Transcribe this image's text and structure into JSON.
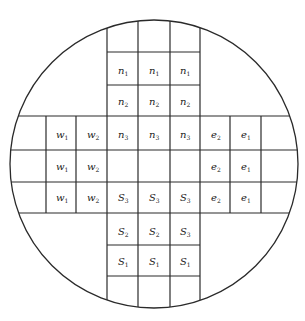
{
  "diagram": {
    "type": "circular-grid-cross",
    "circle": {
      "cx": 154,
      "cy": 164,
      "r": 144
    },
    "colors": {
      "line": "#2a2a2a",
      "text": "#222222",
      "background": "#ffffff"
    },
    "vertical_band": {
      "x": [
        107,
        138,
        170,
        200
      ],
      "y_top": 0,
      "y_bottom": 321
    },
    "horizontal_band": {
      "y": [
        116,
        150,
        182,
        213
      ],
      "x_left": 0,
      "x_right": 305
    },
    "vertical_band_row_lines": [
      52,
      85,
      245,
      276
    ],
    "horizontal_band_col_lines": [
      46,
      76,
      230,
      261
    ],
    "labels": [
      {
        "id": "n1-a",
        "base": "n",
        "sub": "1",
        "x": 122,
        "y": 71
      },
      {
        "id": "n1-b",
        "base": "n",
        "sub": "1",
        "x": 153,
        "y": 71
      },
      {
        "id": "n1-c",
        "base": "n",
        "sub": "1",
        "x": 184,
        "y": 71
      },
      {
        "id": "n2-a",
        "base": "n",
        "sub": "2",
        "x": 122,
        "y": 102
      },
      {
        "id": "n2-b",
        "base": "n",
        "sub": "2",
        "x": 153,
        "y": 102
      },
      {
        "id": "n2-c",
        "base": "n",
        "sub": "2",
        "x": 184,
        "y": 102
      },
      {
        "id": "n3-a",
        "base": "n",
        "sub": "3",
        "x": 122,
        "y": 135
      },
      {
        "id": "n3-b",
        "base": "n",
        "sub": "3",
        "x": 153,
        "y": 135
      },
      {
        "id": "n3-c",
        "base": "n",
        "sub": "3",
        "x": 184,
        "y": 135
      },
      {
        "id": "w1-a",
        "base": "w",
        "sub": "1",
        "x": 60,
        "y": 135
      },
      {
        "id": "w2-a",
        "base": "w",
        "sub": "2",
        "x": 91,
        "y": 135
      },
      {
        "id": "w1-b",
        "base": "w",
        "sub": "1",
        "x": 60,
        "y": 167
      },
      {
        "id": "w2-b",
        "base": "w",
        "sub": "2",
        "x": 91,
        "y": 167
      },
      {
        "id": "w1-c",
        "base": "w",
        "sub": "1",
        "x": 60,
        "y": 198
      },
      {
        "id": "w2-c",
        "base": "w",
        "sub": "2",
        "x": 91,
        "y": 198
      },
      {
        "id": "e2-a",
        "base": "e",
        "sub": "2",
        "x": 215,
        "y": 135
      },
      {
        "id": "e1-a",
        "base": "e",
        "sub": "1",
        "x": 245,
        "y": 135
      },
      {
        "id": "e2-b",
        "base": "e",
        "sub": "2",
        "x": 215,
        "y": 167
      },
      {
        "id": "e1-b",
        "base": "e",
        "sub": "1",
        "x": 245,
        "y": 167
      },
      {
        "id": "e2-c",
        "base": "e",
        "sub": "2",
        "x": 215,
        "y": 198
      },
      {
        "id": "e1-c",
        "base": "e",
        "sub": "1",
        "x": 245,
        "y": 198
      },
      {
        "id": "S3-a",
        "base": "S",
        "sub": "3",
        "x": 122,
        "y": 198
      },
      {
        "id": "S3-b",
        "base": "S",
        "sub": "3",
        "x": 153,
        "y": 198
      },
      {
        "id": "S3-c",
        "base": "S",
        "sub": "3",
        "x": 184,
        "y": 198
      },
      {
        "id": "S2-a",
        "base": "S",
        "sub": "2",
        "x": 122,
        "y": 232
      },
      {
        "id": "S2-b",
        "base": "S",
        "sub": "2",
        "x": 153,
        "y": 232
      },
      {
        "id": "S2-c",
        "base": "S",
        "sub": "3",
        "x": 184,
        "y": 232
      },
      {
        "id": "S1-a",
        "base": "S",
        "sub": "1",
        "x": 122,
        "y": 262
      },
      {
        "id": "S1-b",
        "base": "S",
        "sub": "1",
        "x": 153,
        "y": 262
      },
      {
        "id": "S1-c",
        "base": "S",
        "sub": "1",
        "x": 184,
        "y": 262
      }
    ]
  }
}
